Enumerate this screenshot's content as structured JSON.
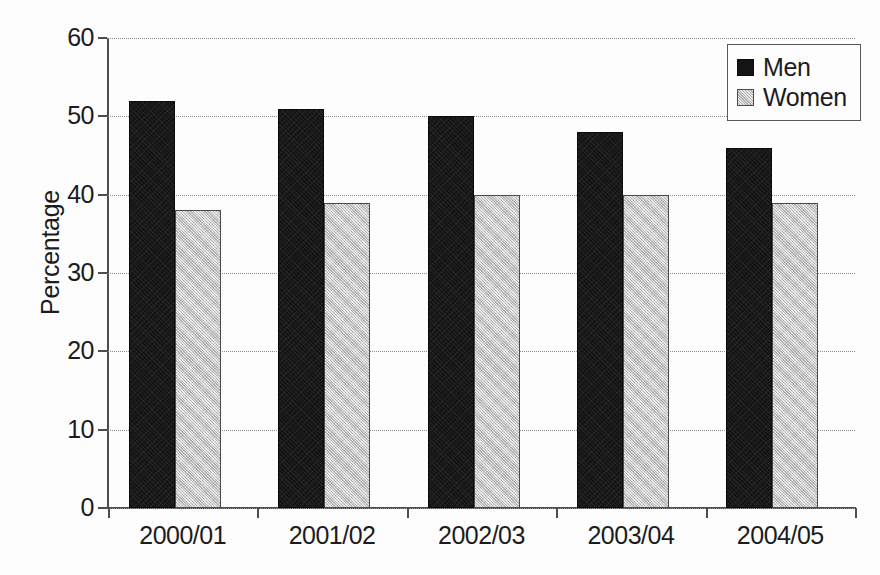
{
  "chart_data": {
    "type": "bar",
    "title": "",
    "subtitle": "",
    "xlabel": "",
    "ylabel": "Percentage",
    "categories": [
      "2000/01",
      "2001/02",
      "2002/03",
      "2003/04",
      "2004/05"
    ],
    "series": [
      {
        "name": "Men",
        "color": "#141414",
        "values": [
          52,
          51,
          50,
          48,
          46
        ]
      },
      {
        "name": "Women",
        "color": "#c6c6c6",
        "values": [
          38,
          39,
          40,
          40,
          39
        ]
      }
    ],
    "ylim": [
      0,
      60
    ],
    "ytick_labels": [
      "0",
      "10",
      "20",
      "30",
      "40",
      "50",
      "60"
    ],
    "ytick_values": [
      0,
      10,
      20,
      30,
      40,
      50,
      60
    ],
    "grid": true,
    "grid_axis": "y",
    "grid_style": "dotted",
    "legend_position": "top-right",
    "legend_entries": [
      "Men",
      "Women"
    ],
    "annotations": []
  },
  "colors": {
    "background": "#fdfdfd",
    "axis": "#4d4d4d",
    "grid": "#8c8c8c",
    "text": "#1c1c1c",
    "men": "#141414",
    "women": "#c6c6c6"
  }
}
